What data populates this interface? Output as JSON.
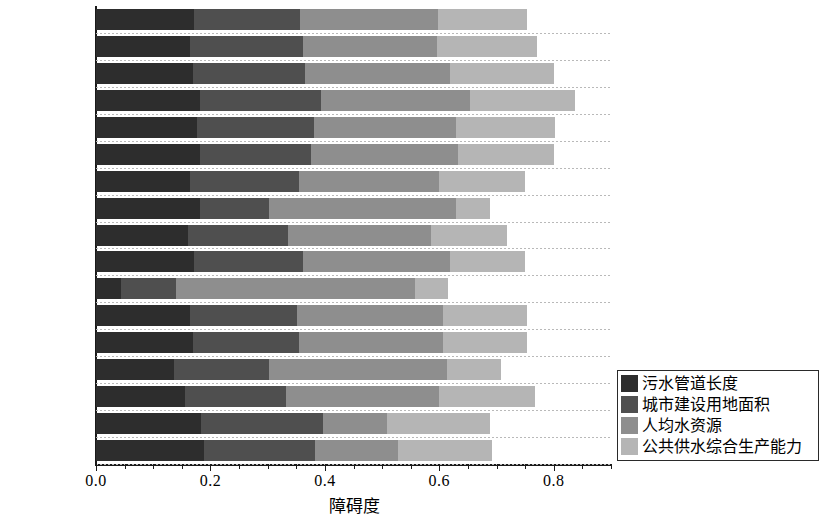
{
  "chart_data": {
    "type": "bar",
    "orientation": "horizontal",
    "stacked": true,
    "title": "",
    "xlabel": "障碍度",
    "ylabel": "",
    "xlim": [
      0.0,
      0.9
    ],
    "xticks": [
      0.0,
      0.2,
      0.4,
      0.6,
      0.8
    ],
    "xtick_labels": [
      "0.0",
      "0.2",
      "0.4",
      "0.6",
      "0.8"
    ],
    "grid": true,
    "legend_position": "right-bottom",
    "categories": [
      "临汾市",
      "忻州市",
      "晋中市",
      "朔州市",
      "晋城市",
      "长治市",
      "阳泉市",
      "太原市",
      "商丘市",
      "平顶山市",
      "郑州市",
      "淮北市",
      "淮南市",
      "徐州市",
      "泰安市",
      "鹤岗市",
      "鸡西市"
    ],
    "series": [
      {
        "name": "污水管道长度",
        "color": "#2d2d2d",
        "values": [
          0.171,
          0.165,
          0.169,
          0.181,
          0.177,
          0.181,
          0.165,
          0.181,
          0.161,
          0.171,
          0.043,
          0.165,
          0.169,
          0.136,
          0.155,
          0.183,
          0.188
        ]
      },
      {
        "name": "城市建设用地面积",
        "color": "#4f4f4f",
        "values": [
          0.186,
          0.196,
          0.196,
          0.213,
          0.204,
          0.194,
          0.189,
          0.122,
          0.175,
          0.19,
          0.097,
          0.186,
          0.186,
          0.167,
          0.177,
          0.213,
          0.195
        ]
      },
      {
        "name": "人均水资源",
        "color": "#8e8e8e",
        "values": [
          0.241,
          0.235,
          0.253,
          0.26,
          0.248,
          0.258,
          0.246,
          0.326,
          0.249,
          0.257,
          0.417,
          0.255,
          0.251,
          0.311,
          0.268,
          0.113,
          0.144
        ]
      },
      {
        "name": "公共供水综合生产能力",
        "color": "#b5b5b5",
        "values": [
          0.155,
          0.174,
          0.182,
          0.183,
          0.173,
          0.167,
          0.15,
          0.06,
          0.133,
          0.132,
          0.058,
          0.148,
          0.148,
          0.093,
          0.167,
          0.179,
          0.165
        ]
      }
    ],
    "totals": [
      0.753,
      0.77,
      0.8,
      0.837,
      0.802,
      0.8,
      0.75,
      0.689,
      0.718,
      0.75,
      0.615,
      0.754,
      0.754,
      0.707,
      0.767,
      0.688,
      0.692
    ]
  },
  "legend": {
    "items": [
      {
        "label": "污水管道长度",
        "color": "#2d2d2d"
      },
      {
        "label": "城市建设用地面积",
        "color": "#4f4f4f"
      },
      {
        "label": "人均水资源",
        "color": "#8e8e8e"
      },
      {
        "label": "公共供水综合生产能力",
        "color": "#b5b5b5"
      }
    ]
  }
}
